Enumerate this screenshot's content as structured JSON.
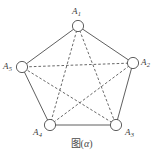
{
  "figure": {
    "type": "complete-graph-pentagon",
    "caption_cjk": "图",
    "caption_paren_open": "(",
    "caption_alpha": "α",
    "caption_paren_close": ")",
    "caption_full": "图(α)",
    "background_color": "#ffffff",
    "edge_color": "#4d4d4d",
    "node_stroke_color": "#4d4d4d",
    "node_fill_color": "#ffffff",
    "label_color": "#3a3a3a"
  },
  "vertices": [
    {
      "id": "A1",
      "label_base": "A",
      "label_sub": "1",
      "cx": 78,
      "cy": 26,
      "r": 5.6
    },
    {
      "id": "A2",
      "label_base": "A",
      "label_sub": "2",
      "cx": 133,
      "cy": 63,
      "r": 5.6
    },
    {
      "id": "A3",
      "label_base": "A",
      "label_sub": "3",
      "cx": 116,
      "cy": 125,
      "r": 5.6
    },
    {
      "id": "A4",
      "label_base": "A",
      "label_sub": "4",
      "cx": 50,
      "cy": 125,
      "r": 5.6
    },
    {
      "id": "A5",
      "label_base": "A",
      "label_sub": "5",
      "cx": 22,
      "cy": 67,
      "r": 5.6
    }
  ],
  "edges_solid": [
    {
      "from": "A1",
      "to": "A2"
    },
    {
      "from": "A2",
      "to": "A3"
    },
    {
      "from": "A3",
      "to": "A4"
    },
    {
      "from": "A4",
      "to": "A5"
    },
    {
      "from": "A5",
      "to": "A1"
    }
  ],
  "edges_dashed": [
    {
      "from": "A1",
      "to": "A3"
    },
    {
      "from": "A1",
      "to": "A4"
    },
    {
      "from": "A2",
      "to": "A4"
    },
    {
      "from": "A2",
      "to": "A5"
    },
    {
      "from": "A3",
      "to": "A5"
    }
  ]
}
